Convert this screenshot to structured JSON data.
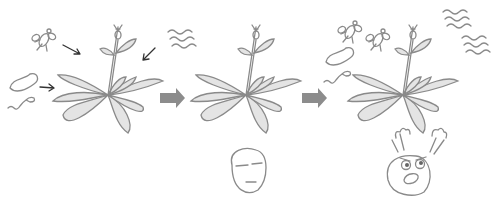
{
  "diagram": {
    "panels": [
      {
        "id": "plant-stressed-input",
        "description": "Plant exposed to insects, pathogens and environmental stress (arrows pointing at plant)"
      },
      {
        "id": "plant-calm",
        "description": "Plant with calm face below"
      },
      {
        "id": "plant-attacked",
        "description": "Plant surrounded by insects, pathogens and stress with an angry face below"
      }
    ],
    "colors": {
      "line": "#8a8a8a",
      "leaf_fill": "#e4e4e4",
      "process_arrow": "#8c8c8c",
      "pointer_arrow": "#333333",
      "background": "#ffffff"
    }
  }
}
